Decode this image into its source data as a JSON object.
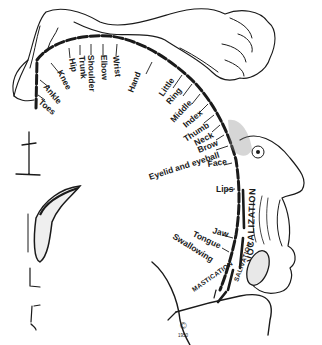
{
  "diagram": {
    "cortex_labels": [
      {
        "key": "toes",
        "text": "Toes",
        "x": 38,
        "y": 103,
        "rot": 40
      },
      {
        "key": "ankle",
        "text": "Ankle",
        "x": 43,
        "y": 87,
        "rot": 50
      },
      {
        "key": "knee",
        "text": "Knee",
        "x": 57,
        "y": 72,
        "rot": 62
      },
      {
        "key": "hip",
        "text": "Hip",
        "x": 69,
        "y": 59,
        "rot": 78
      },
      {
        "key": "trunk",
        "text": "Trunk",
        "x": 79,
        "y": 56,
        "rot": 85
      },
      {
        "key": "shoulder",
        "text": "Shoulder",
        "x": 88,
        "y": 55,
        "rot": 88
      },
      {
        "key": "elbow",
        "text": "Elbow",
        "x": 101,
        "y": 55,
        "rot": 88
      },
      {
        "key": "wrist",
        "text": "Wrist",
        "x": 113,
        "y": 56,
        "rot": 84
      },
      {
        "key": "hand",
        "text": "Hand",
        "x": 133,
        "y": 93,
        "rot": -68
      },
      {
        "key": "little",
        "text": "Little",
        "x": 163,
        "y": 97,
        "rot": -55
      },
      {
        "key": "ring",
        "text": "Ring",
        "x": 170,
        "y": 105,
        "rot": -50
      },
      {
        "key": "middle",
        "text": "Middle",
        "x": 174,
        "y": 123,
        "rot": -47
      },
      {
        "key": "index",
        "text": "Index",
        "x": 186,
        "y": 128,
        "rot": -40
      },
      {
        "key": "thumb",
        "text": "Thumb",
        "x": 186,
        "y": 142,
        "rot": -33
      },
      {
        "key": "neck",
        "text": "Neck",
        "x": 196,
        "y": 146,
        "rot": -27
      },
      {
        "key": "brow",
        "text": "Brow",
        "x": 199,
        "y": 153,
        "rot": -22
      },
      {
        "key": "eyelid_eyeball",
        "text": "Eyelid and eyeball",
        "x": 150,
        "y": 180,
        "rot": -18
      },
      {
        "key": "face",
        "text": "Face",
        "x": 208,
        "y": 167,
        "rot": -8
      },
      {
        "key": "lips",
        "text": "Lips",
        "x": 216,
        "y": 192,
        "rot": 0
      },
      {
        "key": "jaw",
        "text": "Jaw",
        "x": 212,
        "y": 233,
        "rot": 15
      },
      {
        "key": "tongue",
        "text": "Tongue",
        "x": 192,
        "y": 236,
        "rot": 25
      },
      {
        "key": "swallowing",
        "text": "Swallowing",
        "x": 172,
        "y": 238,
        "rot": 32
      }
    ],
    "vertical_labels": {
      "vocalization": "VOCALIZATION",
      "salivation": "SALIVATION",
      "mastication": "MASTICATION"
    },
    "copyright_mark": "©",
    "copyright_year": "1950",
    "colors": {
      "ink": "#1a1a1a",
      "background": "#ffffff",
      "shade": "#8a8a8a"
    }
  }
}
